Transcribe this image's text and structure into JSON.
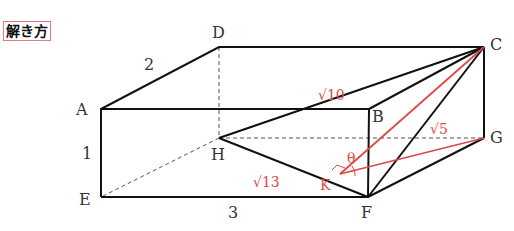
{
  "badge": {
    "text": "解き方"
  },
  "vertices": {
    "A": {
      "label": "A",
      "x": 101,
      "y": 109
    },
    "B": {
      "label": "B",
      "x": 369,
      "y": 109
    },
    "C": {
      "label": "C",
      "x": 484,
      "y": 47
    },
    "D": {
      "label": "D",
      "x": 219,
      "y": 47
    },
    "E": {
      "label": "E",
      "x": 101,
      "y": 197
    },
    "F": {
      "label": "F",
      "x": 368,
      "y": 197
    },
    "G": {
      "label": "G",
      "x": 484,
      "y": 138
    },
    "H": {
      "label": "H",
      "x": 219,
      "y": 138
    },
    "K": {
      "label": "K",
      "x": 340,
      "y": 174
    }
  },
  "edge_labels": {
    "AD": "2",
    "AE": "1",
    "EF": "3",
    "CH": "√10",
    "CG": "√5",
    "HK": "√13",
    "angle": "θ"
  },
  "colors": {
    "black": "#111111",
    "red": "#e04848",
    "dashed": "#555555"
  }
}
